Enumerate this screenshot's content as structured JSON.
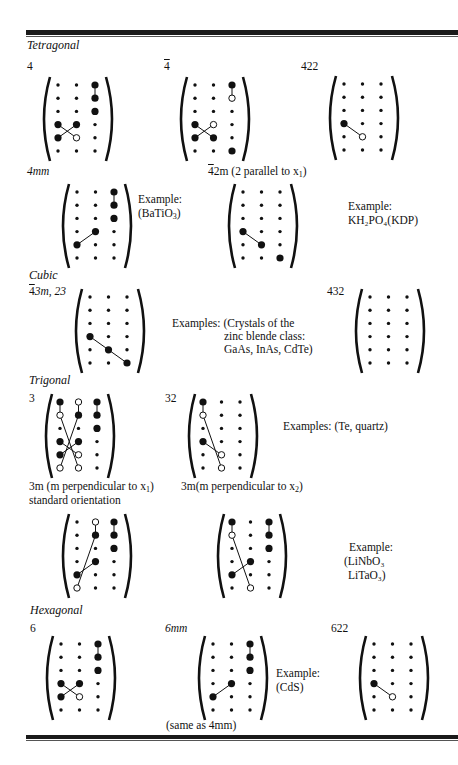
{
  "sections": {
    "tetragonal": "Tetragonal",
    "cubic": "Cubic",
    "trigonal": "Trigonal",
    "hexagonal": "Hexagonal"
  },
  "labels": {
    "c4": "4",
    "c4bar": "4",
    "c422": "422",
    "c4mm": "4mm",
    "c42m_bar": "4",
    "c42m_rest": "2m (2 parallel to x",
    "c42m_sub": "1",
    "c42m_close": ")",
    "c43m_bar": "4",
    "c43m_rest": "3m, 23",
    "c432": "432",
    "c3": "3",
    "c32": "32",
    "c3m1_a": "3m (m perpendicular to x",
    "c3m1_sub": "1",
    "c3m1_close": ")",
    "c3m1_b": "standard orientation",
    "c3m2_a": "3m(m perpendicular to x",
    "c3m2_sub": "2",
    "c3m2_close": ")",
    "c6": "6",
    "c6mm": "6mm",
    "c622": "622",
    "same_as": "(same as 4mm)"
  },
  "examples": {
    "batio3_head": "Example:",
    "batio3_body": "(BaTiO",
    "batio3_sub": "3",
    "batio3_close": ")",
    "kdp_head": "Example:",
    "kdp_body": "KH₂PO₄(KDP)",
    "zinc_head": "Examples: (Crystals of the",
    "zinc_l2": "zinc blende class:",
    "zinc_l3": "GaAs, InAs, CdTe)",
    "te_quartz": "Examples: (Te, quartz)",
    "linbo3_head": "Example:",
    "linbo3_l2": "(LiNbO₃",
    "linbo3_l3": "LiTaO₃)",
    "cds_head": "Example:",
    "cds_body": "(CdS)"
  },
  "matrix_legend": {
    "small_dot": "zero element",
    "large_dot": "nonzero element",
    "open_circle": "equal and opposite element",
    "line": "equal elements connected"
  },
  "matrices": {
    "m4": {
      "grid": [
        "ssL",
        "ssL",
        "ssL",
        "LLs",
        "Los",
        "sss"
      ],
      "lines": [
        [
          0,
          2,
          1,
          2
        ],
        [
          3,
          0,
          4,
          1
        ],
        [
          3,
          1,
          4,
          0
        ]
      ]
    },
    "m4bar": {
      "grid": [
        "ssL",
        "sso",
        "sss",
        "Los",
        "LLs",
        "ssL"
      ],
      "lines": [
        [
          0,
          2,
          1,
          2
        ],
        [
          3,
          0,
          4,
          1
        ],
        [
          3,
          1,
          4,
          0
        ]
      ]
    },
    "m422": {
      "grid": [
        "sss",
        "sss",
        "sss",
        "Lss",
        "sos",
        "sss"
      ],
      "lines": [
        [
          3,
          0,
          4,
          1
        ]
      ]
    },
    "m4mm": {
      "grid": [
        "ssL",
        "ssL",
        "ssL",
        "sLs",
        "Lss",
        "sss"
      ],
      "lines": [
        [
          0,
          2,
          1,
          2
        ],
        [
          3,
          1,
          4,
          0
        ]
      ]
    },
    "m42m": {
      "grid": [
        "sss",
        "sss",
        "sss",
        "Lss",
        "sLs",
        "ssL"
      ],
      "lines": [
        [
          3,
          0,
          4,
          1
        ]
      ]
    },
    "m43m": {
      "grid": [
        "sss",
        "sss",
        "sss",
        "Lss",
        "sLs",
        "ssL"
      ],
      "lines": [
        [
          3,
          0,
          4,
          1
        ],
        [
          4,
          1,
          5,
          2
        ]
      ]
    },
    "m432": {
      "grid": [
        "sss",
        "sss",
        "sss",
        "sss",
        "sss",
        "sss"
      ],
      "lines": []
    },
    "m3": {
      "grid": [
        "LoL",
        "oLL",
        "ssL",
        "LLs",
        "Los",
        "oos"
      ],
      "lines": [
        [
          0,
          0,
          1,
          0
        ],
        [
          0,
          1,
          1,
          1
        ],
        [
          0,
          2,
          1,
          2
        ],
        [
          1,
          0,
          5,
          1
        ],
        [
          1,
          1,
          5,
          0
        ],
        [
          3,
          0,
          4,
          1
        ],
        [
          3,
          1,
          4,
          0
        ]
      ]
    },
    "m32": {
      "grid": [
        "Lss",
        "oss",
        "sss",
        "Lss",
        "sos",
        "sos"
      ],
      "lines": [
        [
          0,
          0,
          1,
          0
        ],
        [
          1,
          0,
          5,
          1
        ],
        [
          3,
          0,
          4,
          1
        ]
      ]
    },
    "m3m1": {
      "grid": [
        "soL",
        "sLL",
        "ssL",
        "sLs",
        "Lss",
        "oss"
      ],
      "lines": [
        [
          0,
          1,
          1,
          1
        ],
        [
          0,
          2,
          1,
          2
        ],
        [
          1,
          1,
          5,
          0
        ],
        [
          3,
          1,
          4,
          0
        ]
      ]
    },
    "m3m2": {
      "grid": [
        "LsL",
        "osL",
        "ssL",
        "sLs",
        "Lss",
        "sos"
      ],
      "lines": [
        [
          0,
          0,
          1,
          0
        ],
        [
          0,
          2,
          1,
          2
        ],
        [
          1,
          0,
          5,
          1
        ],
        [
          3,
          1,
          4,
          0
        ]
      ]
    },
    "m6": {
      "grid": [
        "ssL",
        "ssL",
        "ssL",
        "LLs",
        "Los",
        "sss"
      ],
      "lines": [
        [
          0,
          2,
          1,
          2
        ],
        [
          3,
          0,
          4,
          1
        ],
        [
          3,
          1,
          4,
          0
        ]
      ]
    },
    "m6mm": {
      "grid": [
        "ssL",
        "ssL",
        "ssL",
        "sLs",
        "Lss",
        "sss"
      ],
      "lines": [
        [
          0,
          2,
          1,
          2
        ],
        [
          3,
          1,
          4,
          0
        ]
      ]
    },
    "m622": {
      "grid": [
        "sss",
        "sss",
        "sss",
        "Lss",
        "sos",
        "sss"
      ],
      "lines": [
        [
          3,
          0,
          4,
          1
        ]
      ]
    }
  }
}
